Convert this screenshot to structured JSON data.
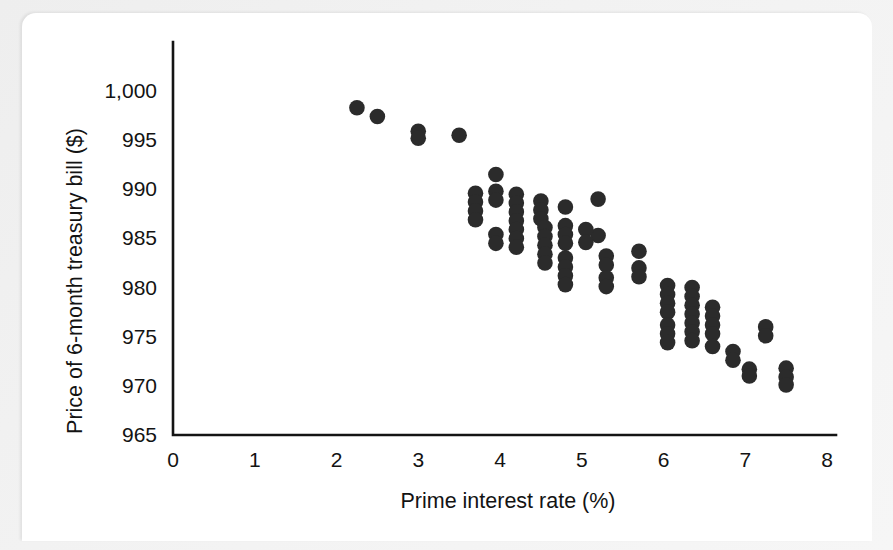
{
  "figure": {
    "background_color": "#f2f2f2",
    "card_color": "#ffffff",
    "marker_color": "#2b2b2b",
    "axis_color": "#141414"
  },
  "chart_data": {
    "type": "scatter",
    "title": "",
    "xlabel": "Prime interest rate (%)",
    "ylabel": "Price of 6-month treasury bill ($)",
    "xlim": [
      0,
      8
    ],
    "ylim": [
      965,
      1000
    ],
    "xticks": [
      0,
      1,
      2,
      3,
      4,
      5,
      6,
      7,
      8
    ],
    "xtick_labels": [
      "0",
      "1",
      "2",
      "3",
      "4",
      "5",
      "6",
      "7",
      "8"
    ],
    "yticks": [
      965,
      970,
      975,
      980,
      985,
      990,
      995,
      1000
    ],
    "ytick_labels": [
      "965",
      "970",
      "975",
      "980",
      "985",
      "990",
      "995",
      "1,000"
    ],
    "grid": false,
    "legend": null,
    "marker": "filled-circle",
    "marker_size": 9,
    "series": [
      {
        "name": "Treasury bill price vs prime rate",
        "points": [
          [
            2.25,
            998.3
          ],
          [
            2.5,
            997.4
          ],
          [
            3.0,
            995.9
          ],
          [
            3.0,
            995.2
          ],
          [
            3.5,
            995.5
          ],
          [
            3.7,
            989.6
          ],
          [
            3.7,
            988.7
          ],
          [
            3.7,
            987.8
          ],
          [
            3.7,
            986.9
          ],
          [
            3.95,
            991.5
          ],
          [
            3.95,
            989.8
          ],
          [
            3.95,
            988.9
          ],
          [
            3.95,
            985.4
          ],
          [
            3.95,
            984.5
          ],
          [
            4.2,
            989.5
          ],
          [
            4.2,
            988.6
          ],
          [
            4.2,
            987.7
          ],
          [
            4.2,
            986.8
          ],
          [
            4.2,
            985.9
          ],
          [
            4.2,
            985.0
          ],
          [
            4.2,
            984.1
          ],
          [
            4.5,
            988.8
          ],
          [
            4.5,
            987.9
          ],
          [
            4.5,
            987.0
          ],
          [
            4.55,
            986.1
          ],
          [
            4.55,
            985.2
          ],
          [
            4.55,
            984.3
          ],
          [
            4.55,
            983.4
          ],
          [
            4.55,
            982.5
          ],
          [
            4.8,
            988.2
          ],
          [
            4.8,
            986.3
          ],
          [
            4.8,
            985.4
          ],
          [
            4.8,
            984.5
          ],
          [
            4.8,
            983.0
          ],
          [
            4.8,
            982.1
          ],
          [
            4.8,
            981.2
          ],
          [
            4.8,
            980.3
          ],
          [
            5.2,
            989.0
          ],
          [
            5.2,
            985.3
          ],
          [
            5.05,
            985.9
          ],
          [
            5.05,
            984.6
          ],
          [
            5.3,
            983.2
          ],
          [
            5.3,
            982.3
          ],
          [
            5.3,
            981.0
          ],
          [
            5.3,
            980.1
          ],
          [
            5.7,
            983.7
          ],
          [
            5.7,
            982.0
          ],
          [
            5.7,
            981.1
          ],
          [
            6.05,
            980.2
          ],
          [
            6.05,
            979.3
          ],
          [
            6.05,
            978.4
          ],
          [
            6.05,
            977.5
          ],
          [
            6.05,
            976.2
          ],
          [
            6.05,
            975.3
          ],
          [
            6.05,
            974.4
          ],
          [
            6.35,
            980.0
          ],
          [
            6.35,
            979.1
          ],
          [
            6.35,
            978.2
          ],
          [
            6.35,
            977.3
          ],
          [
            6.35,
            976.4
          ],
          [
            6.35,
            975.5
          ],
          [
            6.35,
            974.6
          ],
          [
            6.6,
            978.0
          ],
          [
            6.6,
            977.1
          ],
          [
            6.6,
            976.2
          ],
          [
            6.6,
            975.3
          ],
          [
            6.6,
            974.0
          ],
          [
            6.85,
            973.5
          ],
          [
            6.85,
            972.6
          ],
          [
            7.05,
            971.7
          ],
          [
            7.05,
            971.0
          ],
          [
            7.25,
            976.0
          ],
          [
            7.25,
            975.1
          ],
          [
            7.5,
            971.8
          ],
          [
            7.5,
            970.9
          ],
          [
            7.5,
            970.1
          ]
        ]
      }
    ]
  }
}
